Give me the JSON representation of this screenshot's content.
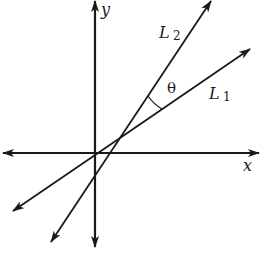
{
  "diagram": {
    "colors": {
      "ink": "#1a1a1a",
      "background": "#ffffff"
    },
    "axes": {
      "x_label": "x",
      "y_label": "y"
    },
    "lines": [
      {
        "id": "L1",
        "label_main": "L",
        "label_sub": "1",
        "passes_through_origin": true
      },
      {
        "id": "L2",
        "label_main": "L",
        "label_sub": "2",
        "passes_through_origin": false
      }
    ],
    "angle": {
      "symbol": "θ",
      "between": [
        "L1",
        "L2"
      ]
    }
  }
}
